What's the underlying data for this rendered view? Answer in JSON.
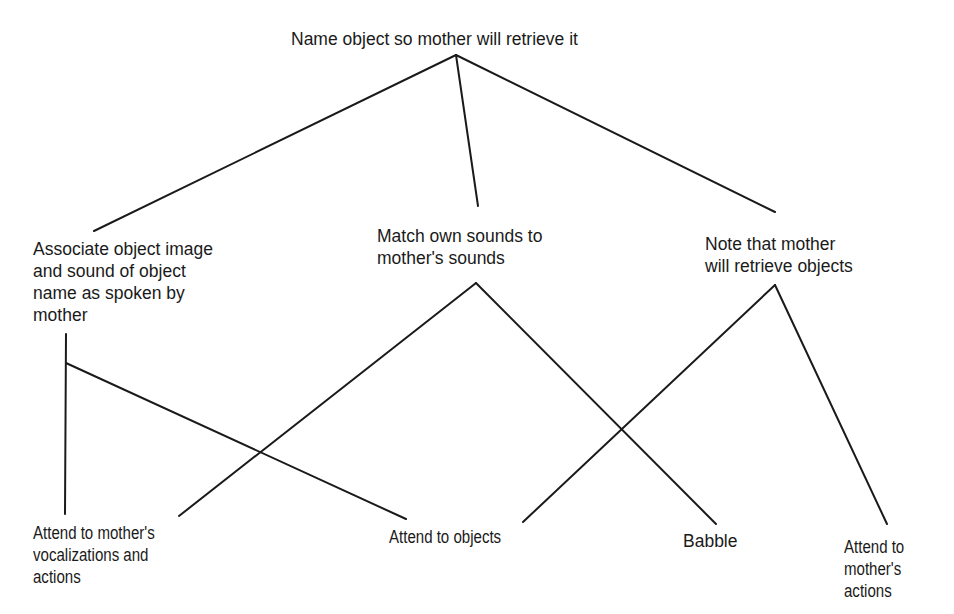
{
  "diagram": {
    "type": "goal-subgoal tree",
    "nodes": {
      "root": {
        "label": "Name object so mother will retrieve it"
      },
      "associate": {
        "label": "Associate object image\nand sound of object\nname as spoken by\nmother"
      },
      "match": {
        "label": "Match own sounds to\nmother's sounds"
      },
      "note": {
        "label": "Note that mother\nwill retrieve objects"
      },
      "attend_vocal": {
        "label": "Attend to mother's\nvocalizations and\nactions"
      },
      "attend_objects": {
        "label": "Attend to objects"
      },
      "babble": {
        "label": "Babble"
      },
      "attend_actions": {
        "label": "Attend to\nmother's\nactions"
      }
    },
    "edges": [
      {
        "from": "root",
        "to": "associate"
      },
      {
        "from": "root",
        "to": "match"
      },
      {
        "from": "root",
        "to": "note"
      },
      {
        "from": "associate",
        "to": "attend_vocal"
      },
      {
        "from": "associate",
        "to": "attend_objects"
      },
      {
        "from": "match",
        "to": "attend_vocal"
      },
      {
        "from": "match",
        "to": "babble"
      },
      {
        "from": "note",
        "to": "attend_objects"
      },
      {
        "from": "note",
        "to": "attend_actions"
      }
    ]
  }
}
